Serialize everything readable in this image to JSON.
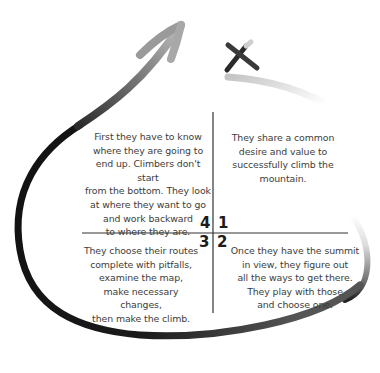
{
  "diagram": {
    "quadrants": [
      {
        "number": "1",
        "position": "top-right",
        "lines": [
          "They share a common",
          "desire and value to",
          "successfully climb the",
          "mountain."
        ]
      },
      {
        "number": "2",
        "position": "bottom-right",
        "lines": [
          "Once they have the summit",
          "in view, they figure out",
          "all the ways to get there.",
          "They play with those",
          "and choose one."
        ]
      },
      {
        "number": "3",
        "position": "bottom-left",
        "lines": [
          "They choose their routes",
          "complete with pitfalls,",
          "examine the map,",
          "make necessary changes,",
          "then make the climb."
        ]
      },
      {
        "number": "4",
        "position": "top-left",
        "lines": [
          "First they have to know",
          "where they are going to",
          "end up. Climbers don't start",
          "from the bottom. They look",
          "at where they want to go",
          "and work backward",
          "to where they are."
        ]
      }
    ],
    "icons": {
      "start_mark": "x-mark-icon",
      "arrow": "curved-arrow-icon"
    },
    "colors": {
      "stroke_dark": "#1a1a1a",
      "stroke_light": "#bdbdbd",
      "text": "#3d3d3d"
    }
  }
}
